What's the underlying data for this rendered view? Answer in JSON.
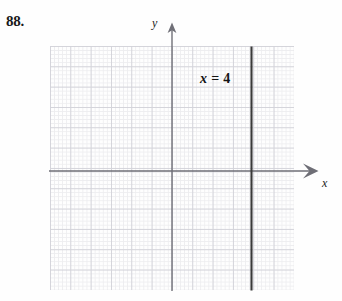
{
  "figure": {
    "problem_number": "88.",
    "graph": {
      "axes": {
        "x_axis_label": "x",
        "y_axis_label": "y",
        "x_arrow_icon": "arrow-right-icon",
        "y_arrow_icon": "arrow-up-icon",
        "x_range": [
          -6,
          6
        ],
        "y_range": [
          -6,
          6
        ],
        "grid": "dotted",
        "grid_major_step": 1,
        "origin": [
          0,
          0
        ]
      },
      "annotations": [
        {
          "name": "equation-label",
          "variable": "x",
          "operator": "=",
          "value": "4",
          "text": "x = 4"
        }
      ],
      "lines": [
        {
          "name": "vertical-line-x-equals-4",
          "type": "vertical",
          "x": 4,
          "color": "#3a3a3a"
        }
      ]
    }
  }
}
